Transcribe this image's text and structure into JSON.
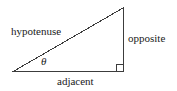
{
  "diagram": {
    "type": "right-triangle-trigonometry",
    "background_color": "#ffffff",
    "stroke_color": "#3c3c3c",
    "text_color": "#1a1a1a",
    "stroke_width": 1,
    "labels": {
      "hypotenuse": "hypotenuse",
      "opposite": "opposite",
      "adjacent": "adjacent",
      "angle": "θ"
    },
    "vertices": {
      "left": {
        "x": 14,
        "y": 71
      },
      "apex": {
        "x": 123,
        "y": 8
      },
      "right_angle": {
        "x": 123,
        "y": 71
      }
    },
    "right_angle_marker": {
      "name": "right-angle-square",
      "size": 7
    }
  }
}
